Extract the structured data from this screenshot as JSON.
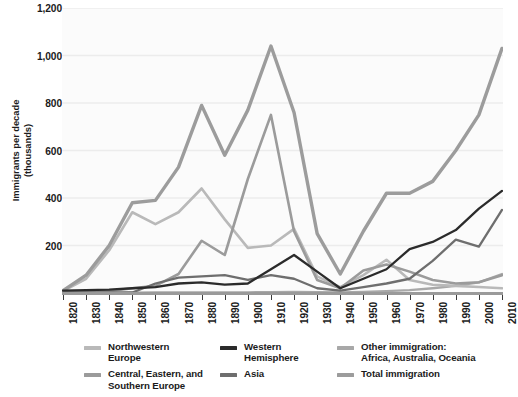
{
  "chart_data": {
    "type": "line",
    "title": "",
    "xlabel": "",
    "ylabel": "Immigrants per decade\n(thousands)",
    "ylabel_line1": "Immigrants per decade",
    "ylabel_line2": "(thousands)",
    "xlim": [
      1820,
      2010
    ],
    "ylim": [
      0,
      1200
    ],
    "grid": true,
    "grid_axis": "y",
    "legend_position": "bottom",
    "yticks": [
      200,
      400,
      600,
      800,
      1000,
      1200
    ],
    "ytick_labels": [
      "200",
      "400",
      "600",
      "800",
      "1,000",
      "1,200"
    ],
    "categories": [
      1820,
      1830,
      1840,
      1850,
      1860,
      1870,
      1880,
      1890,
      1900,
      1910,
      1920,
      1930,
      1940,
      1950,
      1960,
      1970,
      1980,
      1990,
      2000,
      2010
    ],
    "xtick_labels": [
      "1820",
      "1830",
      "1840",
      "1850",
      "1860",
      "1870",
      "1880",
      "1890",
      "1900",
      "1910",
      "1920",
      "1930",
      "1940",
      "1950",
      "1960",
      "1970",
      "1980",
      "1990",
      "2000",
      "2010"
    ],
    "series": [
      {
        "name": "Northwestern Europe",
        "color": "#b9b9b9",
        "width": 2.6,
        "values": [
          8,
          60,
          180,
          340,
          290,
          340,
          440,
          310,
          190,
          200,
          270,
          70,
          25,
          75,
          140,
          55,
          35,
          30,
          25,
          20
        ]
      },
      {
        "name": "Central, Eastern, and Southern Europe",
        "color": "#9b9b9b",
        "width": 2.6,
        "values": [
          2,
          4,
          8,
          20,
          30,
          80,
          220,
          160,
          480,
          750,
          260,
          55,
          20,
          95,
          120,
          90,
          55,
          40,
          45,
          75
        ]
      },
      {
        "name": "Western Hemisphere",
        "color": "#2b2b2b",
        "width": 2.3,
        "values": [
          10,
          12,
          14,
          20,
          25,
          40,
          45,
          35,
          40,
          100,
          160,
          90,
          20,
          60,
          100,
          185,
          215,
          265,
          355,
          430
        ]
      },
      {
        "name": "Asia",
        "color": "#6e6e6e",
        "width": 2.3,
        "values": [
          1,
          1,
          1,
          2,
          40,
          65,
          70,
          75,
          55,
          75,
          60,
          20,
          10,
          25,
          40,
          60,
          135,
          225,
          195,
          350
        ]
      },
      {
        "name": "Other immigration: Africa, Australia, Oceania",
        "color": "#a8a8a8",
        "width": 2.3,
        "values": [
          1,
          1,
          1,
          1,
          2,
          2,
          3,
          3,
          3,
          4,
          5,
          4,
          3,
          5,
          8,
          12,
          20,
          30,
          45,
          80
        ]
      },
      {
        "name": "Total immigration",
        "color": "#9c9c9c",
        "width": 3.4,
        "values": [
          10,
          75,
          200,
          380,
          390,
          530,
          790,
          580,
          770,
          1040,
          760,
          250,
          80,
          260,
          420,
          420,
          470,
          600,
          750,
          1030
        ]
      }
    ]
  },
  "legend": {
    "columns": [
      [
        {
          "label": "Northwestern\nEurope",
          "color": "#b9b9b9",
          "icon": "line-swatch-icon"
        },
        {
          "label": "Central, Eastern, and\nSouthern Europe",
          "color": "#9b9b9b",
          "icon": "line-swatch-icon"
        }
      ],
      [
        {
          "label": "Western\nHemisphere",
          "color": "#2b2b2b",
          "icon": "line-swatch-icon"
        },
        {
          "label": "Asia",
          "color": "#6e6e6e",
          "icon": "line-swatch-icon"
        }
      ],
      [
        {
          "label": "Other immigration:\nAfrica, Australia, Oceania",
          "color": "#a8a8a8",
          "icon": "line-swatch-icon"
        },
        {
          "label": "Total immigration",
          "color": "#9c9c9c",
          "icon": "line-swatch-icon"
        }
      ]
    ]
  },
  "colors": {
    "background": "#ffffff",
    "plot_background": "#fbfbfb",
    "gridline": "#ececec",
    "axis": "#9a9a9a",
    "text": "#1b1b1b"
  }
}
